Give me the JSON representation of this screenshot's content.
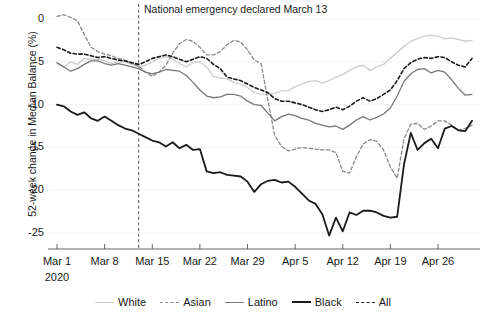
{
  "chart_data": {
    "type": "line",
    "title": "",
    "xlabel": "",
    "ylabel": "52-week change in Median Balance (%)",
    "ylim": [
      -27.5,
      1.5
    ],
    "yticks": [
      0,
      -5,
      -10,
      -15,
      -20,
      -25
    ],
    "ytick_labels": [
      "0",
      "-5",
      "-10",
      "-15",
      "-20",
      "-25"
    ],
    "xtick_labels": [
      "Mar 1",
      "Mar 8",
      "Mar 15",
      "Mar 22",
      "Mar 29",
      "Apr 5",
      "Apr 12",
      "Apr 19",
      "Apr 26"
    ],
    "x_origin_year": "2020",
    "x_index_range": [
      0,
      61
    ],
    "grid": false,
    "legend_position": "bottom",
    "annotations": [
      {
        "text": "National emergency declared March 13",
        "x_index": 12,
        "type": "vline-label",
        "line_style": "dashed",
        "color": "#555555"
      }
    ],
    "series": [
      {
        "name": "White",
        "color": "#cfcfcf",
        "style": "solid",
        "width": 1.4,
        "values": [
          -5.2,
          -5.6,
          -5.0,
          -5.3,
          -4.6,
          -4.7,
          -4.7,
          -4.9,
          -5.2,
          -5.0,
          -5.0,
          -5.3,
          -5.6,
          -5.4,
          -5.0,
          -4.6,
          -4.4,
          -4.7,
          -5.2,
          -5.6,
          -5.1,
          -5.0,
          -5.6,
          -6.7,
          -6.9,
          -7.0,
          -7.4,
          -7.6,
          -8.0,
          -8.6,
          -8.8,
          -8.8,
          -8.7,
          -8.4,
          -8.4,
          -7.9,
          -7.6,
          -7.3,
          -7.2,
          -7.5,
          -7.2,
          -6.8,
          -6.5,
          -6.0,
          -5.6,
          -5.4,
          -6.0,
          -5.6,
          -5.3,
          -4.6,
          -3.9,
          -3.2,
          -2.6,
          -2.3,
          -2.0,
          -1.9,
          -2.0,
          -2.3,
          -2.2,
          -2.4,
          -2.6,
          -2.5
        ]
      },
      {
        "name": "Asian",
        "color": "#8a8a8a",
        "style": "dashed",
        "width": 1.3,
        "values": [
          0.3,
          0.5,
          0.2,
          -0.2,
          -1.8,
          -3.3,
          -3.8,
          -4.1,
          -4.3,
          -4.6,
          -4.8,
          -5.2,
          -5.5,
          -6.2,
          -6.7,
          -6.2,
          -5.4,
          -4.0,
          -2.9,
          -2.4,
          -2.6,
          -3.3,
          -4.2,
          -4.2,
          -3.8,
          -3.0,
          -2.5,
          -2.7,
          -3.6,
          -4.8,
          -5.2,
          -9.5,
          -13.6,
          -14.9,
          -15.4,
          -15.2,
          -15.0,
          -15.1,
          -15.2,
          -15.3,
          -15.3,
          -15.6,
          -17.8,
          -18.0,
          -16.1,
          -14.6,
          -14.1,
          -14.3,
          -15.3,
          -17.3,
          -18.6,
          -14.0,
          -12.3,
          -12.2,
          -12.9,
          -12.5,
          -11.9,
          -11.9,
          -12.4,
          -13.0,
          -12.8,
          -12.4
        ]
      },
      {
        "name": "Latino",
        "color": "#777777",
        "style": "solid",
        "width": 1.3,
        "values": [
          -5.1,
          -5.6,
          -6.1,
          -5.8,
          -5.3,
          -4.9,
          -4.9,
          -5.2,
          -5.4,
          -5.2,
          -5.4,
          -5.6,
          -5.8,
          -6.2,
          -6.4,
          -6.2,
          -5.9,
          -6.0,
          -6.1,
          -6.6,
          -7.4,
          -8.3,
          -9.0,
          -9.2,
          -9.1,
          -8.8,
          -8.8,
          -9.0,
          -9.6,
          -10.0,
          -10.1,
          -11.0,
          -11.9,
          -11.4,
          -11.1,
          -11.3,
          -11.6,
          -11.8,
          -12.2,
          -12.4,
          -12.6,
          -12.5,
          -12.9,
          -12.4,
          -11.8,
          -11.4,
          -11.8,
          -11.5,
          -11.1,
          -10.4,
          -9.0,
          -7.3,
          -6.4,
          -5.9,
          -5.8,
          -6.3,
          -6.0,
          -6.2,
          -7.1,
          -8.1,
          -8.9,
          -8.8
        ]
      },
      {
        "name": "Black",
        "color": "#1a1a1a",
        "style": "solid",
        "width": 1.8,
        "values": [
          -10.0,
          -10.2,
          -10.8,
          -11.2,
          -10.9,
          -11.6,
          -11.9,
          -11.4,
          -11.9,
          -12.4,
          -12.8,
          -13.0,
          -13.4,
          -13.8,
          -14.2,
          -14.4,
          -14.9,
          -14.4,
          -15.1,
          -14.7,
          -15.3,
          -15.2,
          -17.8,
          -18.0,
          -17.9,
          -18.2,
          -18.3,
          -18.4,
          -19.0,
          -20.2,
          -19.3,
          -18.9,
          -18.8,
          -19.1,
          -19.0,
          -19.6,
          -20.4,
          -21.2,
          -21.6,
          -22.8,
          -25.3,
          -23.2,
          -24.8,
          -22.6,
          -22.9,
          -22.4,
          -22.4,
          -22.6,
          -23.0,
          -23.2,
          -23.1,
          -17.0,
          -13.3,
          -15.3,
          -14.5,
          -14.0,
          -15.1,
          -12.8,
          -12.5,
          -13.0,
          -13.1,
          -11.9
        ]
      },
      {
        "name": "All",
        "color": "#1a1a1a",
        "style": "dashed",
        "width": 1.6,
        "values": [
          -3.3,
          -3.6,
          -4.0,
          -4.1,
          -4.1,
          -4.3,
          -4.5,
          -4.4,
          -4.6,
          -4.8,
          -4.9,
          -5.1,
          -5.3,
          -5.0,
          -4.6,
          -4.4,
          -4.2,
          -4.4,
          -4.7,
          -5.0,
          -4.7,
          -4.4,
          -4.6,
          -5.3,
          -5.8,
          -6.8,
          -7.0,
          -7.2,
          -7.6,
          -8.0,
          -8.3,
          -8.6,
          -9.3,
          -9.6,
          -9.6,
          -9.8,
          -10.0,
          -10.3,
          -10.6,
          -10.8,
          -10.6,
          -10.3,
          -10.6,
          -10.2,
          -9.6,
          -9.2,
          -9.6,
          -9.3,
          -8.8,
          -8.3,
          -7.2,
          -5.8,
          -5.1,
          -4.7,
          -4.5,
          -4.6,
          -4.4,
          -4.5,
          -5.0,
          -5.4,
          -5.6,
          -4.6
        ]
      }
    ]
  },
  "axis": {
    "y_title": "52-week change in Median Balance (%)",
    "x_year_label": "2020"
  },
  "legend": {
    "items": [
      {
        "label": "White"
      },
      {
        "label": "Asian"
      },
      {
        "label": "Latino"
      },
      {
        "label": "Black"
      },
      {
        "label": "All"
      }
    ]
  },
  "annotation": {
    "emergency_text": "National emergency declared March 13"
  }
}
